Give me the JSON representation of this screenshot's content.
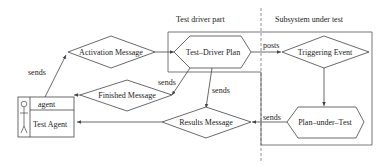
{
  "regions": {
    "test_driver": "Test driver part",
    "subsystem": "Subsystem under test"
  },
  "nodes": {
    "activation": "Activation Message",
    "driver_plan": "Test–Driver Plan",
    "triggering": "Triggering Event",
    "finished": "Finished Message",
    "results": "Results Message",
    "plan_under_test": "Plan–under–Test",
    "agent_stereotype": "agent",
    "agent_name": "Test Agent"
  },
  "edges": {
    "agent_to_activation": "sends",
    "driver_to_finished": "sends",
    "driver_to_results": "sends",
    "driver_to_triggering": "posts",
    "put_to_results": "sends"
  }
}
